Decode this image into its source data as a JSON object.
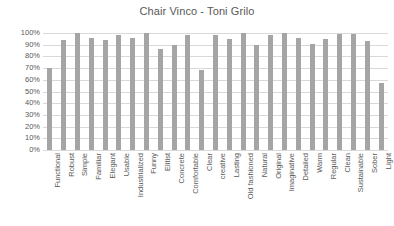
{
  "chart_data": {
    "type": "bar",
    "title": "Chair Vinco - Toni Grilo",
    "xlabel": "",
    "ylabel": "",
    "ylim": [
      0,
      100
    ],
    "ytick_labels": [
      "100%",
      "90%",
      "80%",
      "70%",
      "60%",
      "50%",
      "40%",
      "30%",
      "20%",
      "10%",
      "0%"
    ],
    "ytick_values": [
      100,
      90,
      80,
      70,
      60,
      50,
      40,
      30,
      20,
      10,
      0
    ],
    "grid": true,
    "legend": false,
    "legend_position": "none",
    "bar_color": "#a5a5a5",
    "grid_color": "#d9d9d9",
    "text_color": "#595959",
    "categories": [
      "Functional",
      "Robust",
      "Simple",
      "Familiar",
      "Elegant",
      "Usable",
      "Industrialized",
      "Funny",
      "Elitist",
      "Concrete",
      "Comfortable",
      "Clear",
      "creative",
      "Lasting",
      "Old fashioned",
      "Natural",
      "Original",
      "Imaginative",
      "Detailed",
      "Warm",
      "Regular",
      "Clean",
      "Sustainable",
      "Sober",
      "Light"
    ],
    "values": [
      70,
      94,
      100,
      96,
      94,
      98,
      96,
      100,
      86,
      90,
      98,
      68,
      98,
      95,
      100,
      90,
      98,
      100,
      96,
      91,
      95,
      99,
      99,
      93,
      57
    ]
  }
}
